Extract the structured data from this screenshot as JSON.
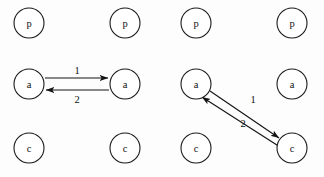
{
  "canvas": {
    "width": 324,
    "height": 177,
    "background_color": "#fdfdfd",
    "stroke_color": "#141414",
    "text_color": "#111111"
  },
  "diagram": {
    "type": "node-link-diagram",
    "node_radius": 15,
    "groups": [
      {
        "id": "left-group",
        "nodes": [
          {
            "id": "L-p1",
            "label": "p",
            "cx": 29,
            "cy": 23
          },
          {
            "id": "L-p2",
            "label": "p",
            "cx": 125,
            "cy": 23
          },
          {
            "id": "L-a1",
            "label": "a",
            "cx": 29,
            "cy": 84
          },
          {
            "id": "L-a2",
            "label": "a",
            "cx": 125,
            "cy": 84
          },
          {
            "id": "L-c1",
            "label": "c",
            "cx": 29,
            "cy": 148
          },
          {
            "id": "L-c2",
            "label": "c",
            "cx": 125,
            "cy": 148
          }
        ],
        "edges": [
          {
            "id": "L-edge-1",
            "label": "1",
            "from": "L-a1",
            "to": "L-a2",
            "x1": 45,
            "y1": 78,
            "x2": 108,
            "y2": 78,
            "label_x": 77,
            "label_y": 70,
            "arrowhead_at": "end"
          },
          {
            "id": "L-edge-2",
            "label": "2",
            "from": "L-a2",
            "to": "L-a1",
            "x1": 109,
            "y1": 90,
            "x2": 46,
            "y2": 90,
            "label_x": 77,
            "label_y": 99,
            "arrowhead_at": "end"
          }
        ]
      },
      {
        "id": "right-group",
        "nodes": [
          {
            "id": "R-p1",
            "label": "p",
            "cx": 196,
            "cy": 23
          },
          {
            "id": "R-p2",
            "label": "p",
            "cx": 292,
            "cy": 23
          },
          {
            "id": "R-a1",
            "label": "a",
            "cx": 196,
            "cy": 84
          },
          {
            "id": "R-a2",
            "label": "a",
            "cx": 292,
            "cy": 84
          },
          {
            "id": "R-c1",
            "label": "c",
            "cx": 196,
            "cy": 148
          },
          {
            "id": "R-c2",
            "label": "c",
            "cx": 292,
            "cy": 148
          }
        ],
        "edges": [
          {
            "id": "R-edge-1",
            "label": "1",
            "from": "R-a1",
            "to": "R-c2",
            "x1": 210,
            "y1": 91,
            "x2": 279,
            "y2": 138,
            "label_x": 253,
            "label_y": 99,
            "arrowhead_at": "end"
          },
          {
            "id": "R-edge-2",
            "label": "2",
            "from": "R-c2",
            "to": "R-a1",
            "x1": 280,
            "y1": 147,
            "x2": 202,
            "y2": 97,
            "label_x": 243,
            "label_y": 123,
            "arrowhead_at": "end"
          }
        ]
      }
    ]
  }
}
